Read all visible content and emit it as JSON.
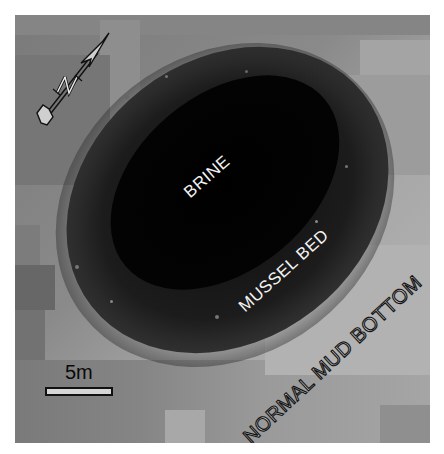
{
  "figure": {
    "type": "seafloor photomosaic",
    "background_color": "#ffffff",
    "labels": {
      "pool": "BRINE",
      "ring": "MUSSEL BED",
      "outer": "NORMAL MUD BOTTOM"
    },
    "scale_bar": {
      "label": "5m"
    },
    "north_arrow": {
      "label": "N",
      "icon": "north-arrow-icon"
    },
    "colors": {
      "brine": "#050505",
      "mussel_bed": "#2a2a2a",
      "mud_light": "#b5b5b5",
      "mud_mid": "#8c8c8c",
      "mud_dark": "#6e6e6e"
    }
  }
}
